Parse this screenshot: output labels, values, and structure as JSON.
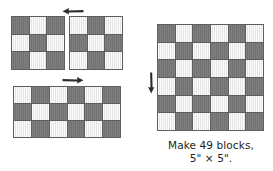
{
  "figure": {
    "colors": {
      "dark_fabric": "#787878",
      "light_fabric": "#ececec",
      "seam_line": "#5e5e5e",
      "arrow": "#2c2c2c",
      "text": "#231f20",
      "background": "#ffffff"
    }
  },
  "blocks": {
    "block_a": {
      "name": "three-by-three-block-dark-corners",
      "rows": 3,
      "cols": 3,
      "cells": [
        [
          "dark",
          "light",
          "dark"
        ],
        [
          "light",
          "dark",
          "light"
        ],
        [
          "dark",
          "light",
          "dark"
        ]
      ]
    },
    "block_b": {
      "name": "three-by-three-block-light-corners",
      "rows": 3,
      "cols": 3,
      "cells": [
        [
          "light",
          "dark",
          "light"
        ],
        [
          "dark",
          "light",
          "dark"
        ],
        [
          "light",
          "dark",
          "light"
        ]
      ]
    },
    "block_strip": {
      "name": "six-by-three-joined-strip",
      "rows": 3,
      "cols": 6,
      "cells": [
        [
          "light",
          "dark",
          "light",
          "dark",
          "light",
          "dark"
        ],
        [
          "dark",
          "light",
          "dark",
          "light",
          "dark",
          "light"
        ],
        [
          "light",
          "dark",
          "light",
          "dark",
          "light",
          "dark"
        ]
      ]
    },
    "block_quilt": {
      "name": "six-by-six-finished-block",
      "rows": 6,
      "cols": 6,
      "cells": [
        [
          "dark",
          "light",
          "dark",
          "light",
          "dark",
          "light"
        ],
        [
          "light",
          "dark",
          "light",
          "dark",
          "light",
          "dark"
        ],
        [
          "dark",
          "light",
          "dark",
          "light",
          "dark",
          "light"
        ],
        [
          "light",
          "dark",
          "light",
          "dark",
          "light",
          "dark"
        ],
        [
          "dark",
          "light",
          "dark",
          "light",
          "dark",
          "light"
        ],
        [
          "light",
          "dark",
          "light",
          "dark",
          "light",
          "dark"
        ]
      ]
    }
  },
  "arrows": [
    {
      "name": "pressing-arrow-left",
      "direction": "left"
    },
    {
      "name": "pressing-arrow-right",
      "direction": "right"
    },
    {
      "name": "pressing-arrow-down",
      "direction": "down"
    }
  ],
  "caption": {
    "line1": "Make 49 blocks,",
    "line2": "5\" × 5\"."
  }
}
